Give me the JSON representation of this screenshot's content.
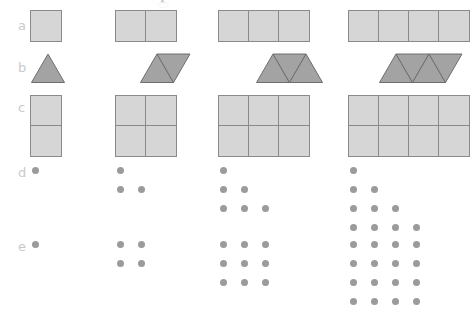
{
  "figure": {
    "title": "",
    "background_color": "#ffffff",
    "rows": [
      {
        "id": "a",
        "label": "a",
        "type": "squares-strip",
        "description": "Row of unit squares joined side by side",
        "fill_color": "#d6d6d6",
        "stroke_color": "#8a8a8a",
        "items": [
          {
            "count": 1,
            "cols": 1,
            "rows": 1
          },
          {
            "count": 2,
            "cols": 2,
            "rows": 1
          },
          {
            "count": 3,
            "cols": 3,
            "rows": 1
          },
          {
            "count": 4,
            "cols": 4,
            "rows": 1
          }
        ]
      },
      {
        "id": "b",
        "label": "b",
        "type": "triangles-strip",
        "description": "Equilateral triangles joined alternately up and down",
        "fill_color": "#a3a3a3",
        "stroke_color": "#6e6e6e",
        "items": [
          {
            "count": 1,
            "orientations": [
              "up"
            ],
            "shape_name": "triangle"
          },
          {
            "count": 2,
            "orientations": [
              "up",
              "down"
            ],
            "shape_name": "rhombus"
          },
          {
            "count": 3,
            "orientations": [
              "up",
              "down",
              "up"
            ],
            "shape_name": "trapezoid"
          },
          {
            "count": 4,
            "orientations": [
              "down",
              "up",
              "down",
              "up"
            ],
            "shape_name": "parallelogram"
          }
        ]
      },
      {
        "id": "c",
        "label": "c",
        "type": "squares-grid",
        "description": "Rectangular grids of unit squares, two rows tall",
        "fill_color": "#d6d6d6",
        "stroke_color": "#8a8a8a",
        "items": [
          {
            "count": 2,
            "cols": 1,
            "rows": 2
          },
          {
            "count": 4,
            "cols": 2,
            "rows": 2
          },
          {
            "count": 6,
            "cols": 3,
            "rows": 2
          },
          {
            "count": 8,
            "cols": 4,
            "rows": 2
          }
        ]
      },
      {
        "id": "d",
        "label": "d",
        "type": "dots-triangular",
        "description": "Triangular numbers drawn as staircase arrays of dots",
        "dot_color": "#9b9b9e",
        "items": [
          {
            "count": 1,
            "row_lengths": [
              1
            ]
          },
          {
            "count": 3,
            "row_lengths": [
              1,
              2
            ]
          },
          {
            "count": 6,
            "row_lengths": [
              1,
              2,
              3
            ]
          },
          {
            "count": 10,
            "row_lengths": [
              1,
              2,
              3,
              4
            ]
          }
        ]
      },
      {
        "id": "e",
        "label": "e",
        "type": "dots-square",
        "description": "Square numbers drawn as square arrays of dots",
        "dot_color": "#9b9b9e",
        "items": [
          {
            "count": 1,
            "rows": 1,
            "cols": 1
          },
          {
            "count": 4,
            "rows": 2,
            "cols": 2
          },
          {
            "count": 9,
            "rows": 3,
            "cols": 3
          },
          {
            "count": 16,
            "rows": 4,
            "cols": 4
          }
        ]
      }
    ],
    "column_x": [
      30,
      115,
      218,
      348
    ],
    "row_y": {
      "a": 10,
      "b": 53,
      "c": 95,
      "d": 163,
      "e": 237
    }
  },
  "chart_data": {
    "type": "table",
    "categories": [
      "term 1",
      "term 2",
      "term 3",
      "term 4"
    ],
    "series": [
      {
        "name": "a  squares in a strip",
        "values": [
          1,
          2,
          3,
          4
        ]
      },
      {
        "name": "b  triangles in a strip",
        "values": [
          1,
          2,
          3,
          4
        ]
      },
      {
        "name": "c  squares in a 2-row grid",
        "values": [
          2,
          4,
          6,
          8
        ]
      },
      {
        "name": "d  dots (triangular numbers)",
        "values": [
          1,
          3,
          6,
          10
        ]
      },
      {
        "name": "e  dots (square numbers)",
        "values": [
          1,
          4,
          9,
          16
        ]
      }
    ],
    "xlabel": "term number",
    "ylabel": "number of pieces / dots",
    "grid": false,
    "legend": "none"
  }
}
